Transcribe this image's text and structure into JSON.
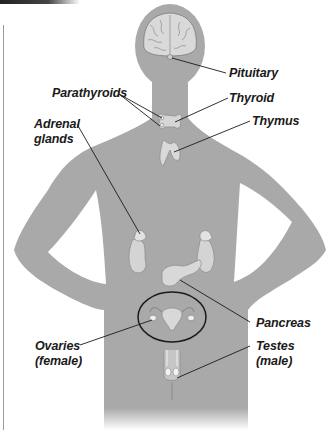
{
  "diagram": {
    "colors": {
      "body": "#a9a9a9",
      "organ": "#d6d6d6",
      "organ_outline": "#8a8a8a",
      "leader_line": "#1a1a1a",
      "background": "#ffffff"
    },
    "labels": [
      {
        "id": "pituitary",
        "text": "Pituitary"
      },
      {
        "id": "parathyroids",
        "text": "Parathyroids"
      },
      {
        "id": "thyroid",
        "text": "Thyroid"
      },
      {
        "id": "thymus",
        "text": "Thymus"
      },
      {
        "id": "adrenal",
        "text": "Adrenal\nglands"
      },
      {
        "id": "pancreas",
        "text": "Pancreas"
      },
      {
        "id": "ovaries",
        "text": "Ovaries\n(female)"
      },
      {
        "id": "testes",
        "text": "Testes\n(male)"
      }
    ]
  }
}
